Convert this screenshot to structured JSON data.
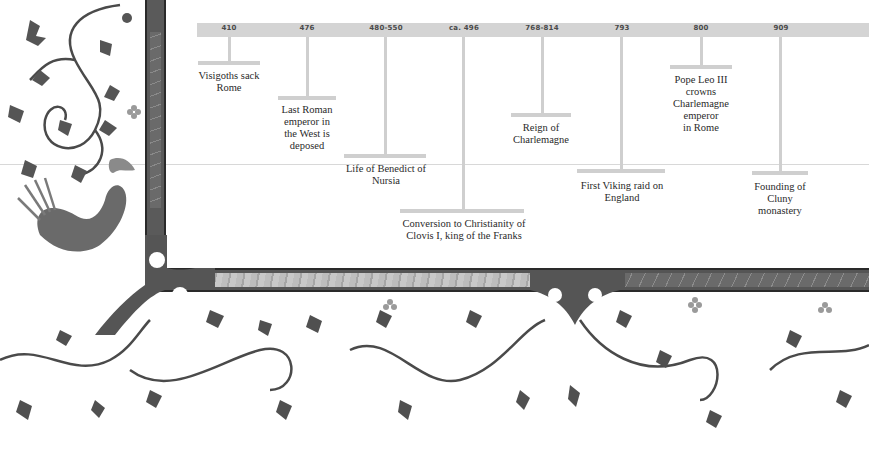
{
  "timeline": {
    "events": [
      {
        "date": "410",
        "label_lines": [
          "Visigoths sack",
          "Rome"
        ]
      },
      {
        "date": "476",
        "label_lines": [
          "Last Roman",
          "emperor in",
          "the West is",
          "deposed"
        ]
      },
      {
        "date": "480-550",
        "label_lines": [
          "Life of Benedict of",
          "Nursia"
        ]
      },
      {
        "date": "ca. 496",
        "label_lines": [
          "Conversion to Christianity of",
          "Clovis I, king of the Franks"
        ]
      },
      {
        "date": "768-814",
        "label_lines": [
          "Reign of",
          "Charlemagne"
        ]
      },
      {
        "date": "793",
        "label_lines": [
          "First Viking raid on",
          "England"
        ]
      },
      {
        "date": "800",
        "label_lines": [
          "Pope Leo III",
          "crowns",
          "Charlemagne",
          "emperor",
          "in Rome"
        ]
      },
      {
        "date": "909",
        "label_lines": [
          "Founding of",
          "Cluny",
          "monastery"
        ]
      }
    ]
  },
  "decoration": {
    "border_style": "illuminated-manuscript",
    "palette": {
      "bar": "#d4d4d4",
      "stem": "#cfcfcf",
      "border_dark": "#555555",
      "border_inset_light": "#bdbdbd",
      "text": "#2a2a2a"
    }
  }
}
